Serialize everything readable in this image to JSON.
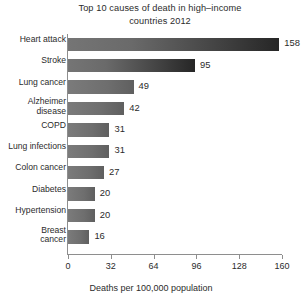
{
  "chart_data": {
    "type": "bar",
    "orientation": "horizontal",
    "title_lines": [
      "Top 10 causes of death in high–income",
      "countries 2012"
    ],
    "xlabel": "Deaths per 100,000 population",
    "ylabel": "",
    "xlim": [
      0,
      160
    ],
    "xticks": [
      0,
      32,
      64,
      96,
      128,
      160
    ],
    "xtick_labels": [
      "0",
      "32",
      "64",
      "96",
      "128",
      "160"
    ],
    "grid": false,
    "legend": false,
    "categories": [
      "Heart attack",
      "Stroke",
      "Lung cancer",
      "Alzheimer disease",
      "COPD",
      "Lung infections",
      "Colon cancer",
      "Diabetes",
      "Hypertension",
      "Breast cancer"
    ],
    "category_label_lines": [
      [
        "Heart attack"
      ],
      [
        "Stroke"
      ],
      [
        "Lung cancer"
      ],
      [
        "Alzheimer",
        "disease"
      ],
      [
        "COPD"
      ],
      [
        "Lung infections"
      ],
      [
        "Colon cancer"
      ],
      [
        "Diabetes"
      ],
      [
        "Hypertension"
      ],
      [
        "Breast",
        "cancer"
      ]
    ],
    "values": [
      158,
      95,
      49,
      42,
      31,
      31,
      27,
      20,
      20,
      16
    ],
    "value_labels": [
      "158",
      "95",
      "49",
      "42",
      "31",
      "31",
      "27",
      "20",
      "20",
      "16"
    ],
    "colors": {
      "background": "#ffffff",
      "bar_light": "#7b7b7b",
      "bar_dark": "#262626",
      "axis": "#8e8e8e",
      "text": "#2b2b2b"
    }
  }
}
